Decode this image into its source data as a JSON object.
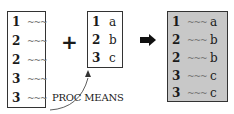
{
  "left_table": {
    "rows": [
      {
        "key": "1",
        "value": "~~~"
      },
      {
        "key": "2",
        "value": "~~~"
      },
      {
        "key": "2",
        "value": "~~~"
      },
      {
        "key": "3",
        "value": "~~~"
      },
      {
        "key": "3",
        "value": "~~~"
      }
    ]
  },
  "middle_table": {
    "rows": [
      {
        "key": "1",
        "value": "a"
      },
      {
        "key": "2",
        "value": "b"
      },
      {
        "key": "3",
        "value": "c"
      }
    ]
  },
  "result_table": {
    "rows": [
      {
        "key": "1",
        "data": "~~~",
        "value": "a"
      },
      {
        "key": "2",
        "data": "~~~",
        "value": "b"
      },
      {
        "key": "2",
        "data": "~~~",
        "value": "b"
      },
      {
        "key": "3",
        "data": "~~~",
        "value": "c"
      },
      {
        "key": "3",
        "data": "~~~",
        "value": "c"
      }
    ],
    "fill_color": "#c8c8c8"
  },
  "operators": {
    "plus": "+",
    "arrow": "right-arrow-icon"
  },
  "annotation": {
    "label": "PROC MEANS"
  }
}
